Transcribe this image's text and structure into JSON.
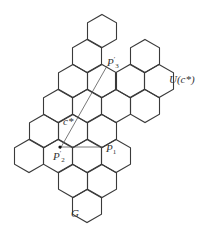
{
  "figure": {
    "type": "hexagonal-tiling-diagram",
    "stroke_color": "#3a3a3a",
    "background": "#ffffff"
  },
  "labels": {
    "p3_prime": {
      "base": "P",
      "sup": "′",
      "sub": "3"
    },
    "c_star": "c*",
    "p2_prime": {
      "base": "P",
      "sup": "′",
      "sub": "2"
    },
    "p1": {
      "base": "P",
      "sub": "1"
    },
    "u_c_star": "U(c*)",
    "g": "G"
  },
  "hexagons": [
    [
      102,
      31
    ],
    [
      87,
      56
    ],
    [
      145,
      56
    ],
    [
      73,
      81
    ],
    [
      102,
      81
    ],
    [
      130,
      81
    ],
    [
      159,
      81
    ],
    [
      58,
      106
    ],
    [
      87,
      106
    ],
    [
      116,
      106
    ],
    [
      145,
      106
    ],
    [
      44,
      131
    ],
    [
      73,
      131
    ],
    [
      102,
      131
    ],
    [
      29,
      156
    ],
    [
      58,
      156
    ],
    [
      87,
      156
    ],
    [
      116,
      156
    ],
    [
      73,
      181
    ],
    [
      102,
      181
    ],
    [
      87,
      206
    ]
  ],
  "points": {
    "p3_prime": [
      107,
      56
    ],
    "p2_prime": [
      60,
      157
    ],
    "p1": [
      102,
      148
    ]
  }
}
